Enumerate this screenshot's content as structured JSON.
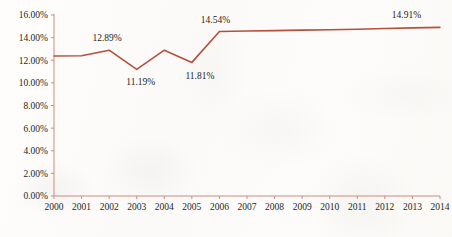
{
  "chart_data": {
    "type": "line",
    "title": "",
    "subtitle": "",
    "xlabel": "",
    "ylabel": "",
    "grid": false,
    "legend": null,
    "legend_position": "none",
    "categories": [
      "2000",
      "2001",
      "2002",
      "2003",
      "2004",
      "2005",
      "2006",
      "2007",
      "2008",
      "2009",
      "2010",
      "2011",
      "2012",
      "2013",
      "2014"
    ],
    "x_tick_labels": [
      "2000",
      "2001",
      "2002",
      "2003",
      "2004",
      "2005",
      "2006",
      "2007",
      "2008",
      "2009",
      "2010",
      "2011",
      "2012",
      "2013",
      "2014"
    ],
    "y_tick_labels": [
      "0.00%",
      "2.00%",
      "4.00%",
      "6.00%",
      "8.00%",
      "10.00%",
      "12.00%",
      "14.00%",
      "16.00%"
    ],
    "y_ticks": [
      0,
      2,
      4,
      6,
      8,
      10,
      12,
      14,
      16
    ],
    "ylim": [
      0,
      16
    ],
    "y_unit": "%",
    "series": [
      {
        "name": "",
        "color": "#b5503c",
        "values": [
          12.38,
          12.4,
          12.89,
          11.19,
          12.89,
          11.81,
          14.54,
          14.58,
          14.62,
          14.66,
          14.7,
          14.74,
          14.8,
          14.86,
          14.91
        ]
      }
    ],
    "annotations": [
      {
        "label": "12.89%",
        "category": "2002",
        "value": 12.89
      },
      {
        "label": "11.19%",
        "category": "2003",
        "value": 11.19
      },
      {
        "label": "11.81%",
        "category": "2005",
        "value": 11.81
      },
      {
        "label": "14.54%",
        "category": "2006",
        "value": 14.54
      },
      {
        "label": "14.91%",
        "category": "2013",
        "value": 14.91
      }
    ],
    "colors": {
      "line": "#b5503c",
      "axis": "#c98e80",
      "text": "#262626",
      "background": "#fdfcfb"
    }
  }
}
